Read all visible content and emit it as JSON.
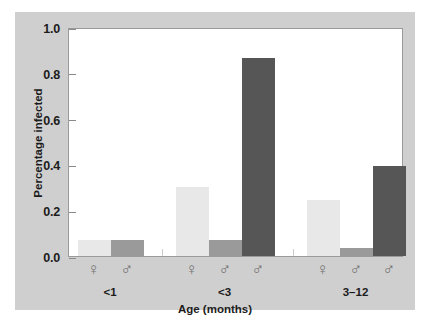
{
  "figure": {
    "background_color": "#cfcfcf",
    "plot_background_color": "#ffffff",
    "frame_color": "#9a9a9a"
  },
  "chart_data": {
    "type": "bar",
    "title": "",
    "xlabel": "Age (months)",
    "ylabel": "Percentage infected",
    "ylim": [
      0.0,
      1.0
    ],
    "yticks": [
      "0.0",
      "0.2",
      "0.4",
      "0.6",
      "0.8",
      "1.0"
    ],
    "ytick_values": [
      0.0,
      0.2,
      0.4,
      0.6,
      0.8,
      1.0
    ],
    "grid": false,
    "legend": "none",
    "group_labels": [
      "<1",
      "<3",
      "3-12"
    ],
    "categories": [
      "♀",
      "♂",
      "♀",
      "♂",
      "♂",
      "♀",
      "♂",
      "♂"
    ],
    "values": [
      0.07,
      0.07,
      0.3,
      0.07,
      0.865,
      0.245,
      0.035,
      0.395
    ],
    "colors": [
      "#e8e8e8",
      "#9a9a9a",
      "#e8e8e8",
      "#9a9a9a",
      "#565656",
      "#e8e8e8",
      "#9a9a9a",
      "#565656"
    ],
    "bars": [
      {
        "group": "<1",
        "sex": "♀",
        "value": 0.07,
        "color": "#e8e8e8"
      },
      {
        "group": "<1",
        "sex": "♂",
        "value": 0.07,
        "color": "#9a9a9a"
      },
      {
        "group": "<3",
        "sex": "♀",
        "value": 0.3,
        "color": "#e8e8e8"
      },
      {
        "group": "<3",
        "sex": "♂",
        "value": 0.07,
        "color": "#9a9a9a"
      },
      {
        "group": "<3",
        "sex": "♂",
        "value": 0.865,
        "color": "#565656"
      },
      {
        "group": "3-12",
        "sex": "♀",
        "value": 0.245,
        "color": "#e8e8e8"
      },
      {
        "group": "3-12",
        "sex": "♂",
        "value": 0.035,
        "color": "#9a9a9a"
      },
      {
        "group": "3-12",
        "sex": "♂",
        "value": 0.395,
        "color": "#565656"
      }
    ]
  }
}
